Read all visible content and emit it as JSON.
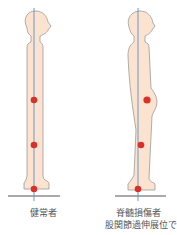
{
  "figures": [
    {
      "id": "healthy",
      "label": "健常者",
      "markers": [
        "knee",
        "ankle-mid",
        "foot"
      ]
    },
    {
      "id": "spinal-cord-injury",
      "label": "脊髄損傷者",
      "sublabel": "股関節過伸展位で",
      "markers": [
        "hip",
        "knee",
        "foot"
      ]
    }
  ],
  "colors": {
    "body_fill": "#fbe3cf",
    "body_outline": "#9a9a9a",
    "center_line": "#5b8fc7",
    "marker": "#d9302a",
    "ground": "#555555",
    "text": "#555555"
  }
}
